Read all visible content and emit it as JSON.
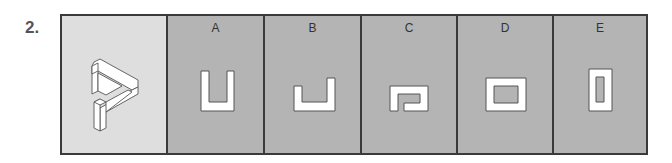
{
  "question": {
    "number": "2."
  },
  "figure": {
    "name": "impossible-triangle-figure"
  },
  "options": [
    {
      "label": "A",
      "shape": "tall-u-shape"
    },
    {
      "label": "B",
      "shape": "short-u-shape-uneven"
    },
    {
      "label": "C",
      "shape": "hook-shape"
    },
    {
      "label": "D",
      "shape": "wide-rect-frame"
    },
    {
      "label": "E",
      "shape": "tall-rect-frame"
    }
  ],
  "colors": {
    "border": "#3a3a3a",
    "question_bg": "#dedede",
    "option_bg": "#b4b4b4",
    "shape_fill": "#ffffff",
    "shape_stroke": "#555555"
  }
}
